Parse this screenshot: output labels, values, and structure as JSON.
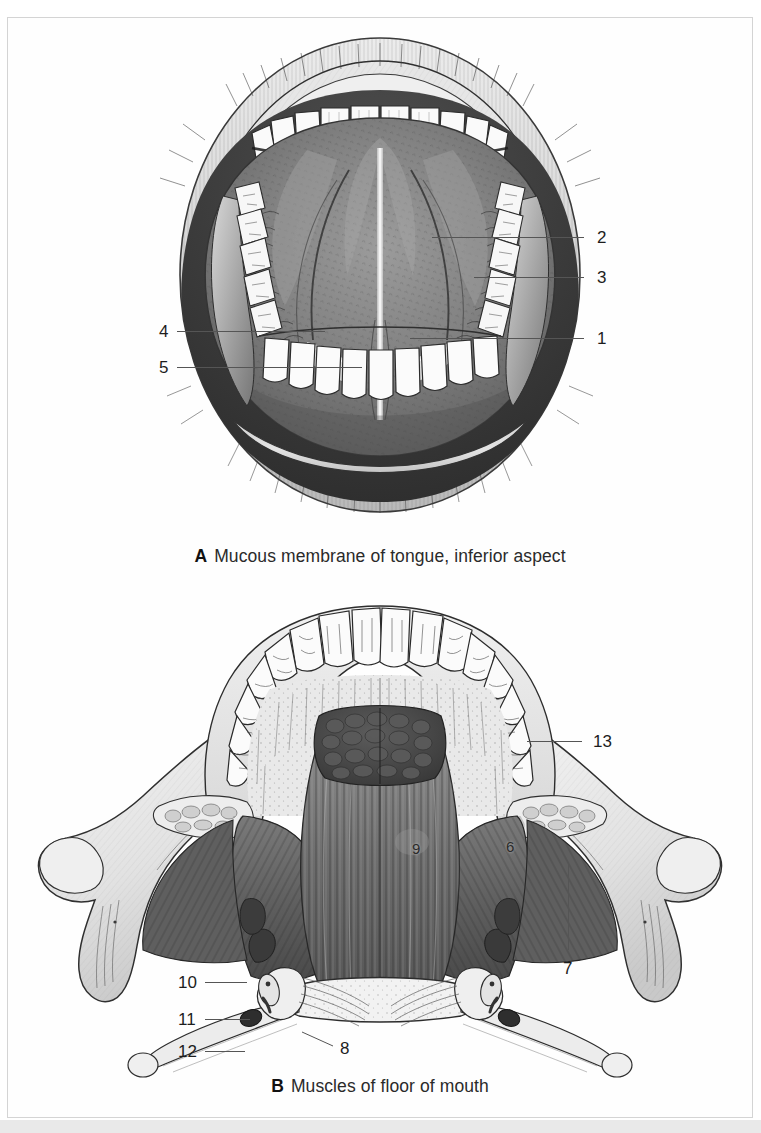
{
  "page": {
    "background_color": "#ffffff",
    "frame_color": "#d4d4d4",
    "bottom_strip_color": "#e9e9e9"
  },
  "figures": [
    {
      "id": "A",
      "letter": "A",
      "caption": "Mucous membrane of tongue, inferior aspect",
      "subject": "open mouth viewed from below, underside of tongue with upper and lower teeth",
      "labels": [
        {
          "number": "1",
          "side": "right",
          "x": 597,
          "y": 330,
          "leader": {
            "x1": 410,
            "y1": 338,
            "x2": 584,
            "y2": 338
          }
        },
        {
          "number": "2",
          "side": "right",
          "x": 597,
          "y": 229,
          "leader": {
            "x1": 432,
            "y1": 237,
            "x2": 584,
            "y2": 237
          }
        },
        {
          "number": "3",
          "side": "right",
          "x": 597,
          "y": 269,
          "leader": {
            "x1": 474,
            "y1": 277,
            "x2": 584,
            "y2": 277
          }
        },
        {
          "number": "4",
          "side": "left",
          "x": 159,
          "y": 323,
          "leader": {
            "x1": 177,
            "y1": 331,
            "x2": 325,
            "y2": 331
          }
        },
        {
          "number": "5",
          "side": "left",
          "x": 159,
          "y": 359,
          "leader": {
            "x1": 177,
            "y1": 367,
            "x2": 362,
            "y2": 367
          }
        }
      ]
    },
    {
      "id": "B",
      "letter": "B",
      "caption": "Muscles of floor of mouth",
      "subject": "mandible viewed from above with teeth arch, genioglossus, mylohyoid and hyoid apparatus",
      "labels": [
        {
          "number": "6",
          "side": "overlay",
          "x": 506,
          "y": 839,
          "leader": null
        },
        {
          "number": "7",
          "side": "right",
          "x": 563,
          "y": 960,
          "leader": {
            "x1": 568,
            "y1": 862,
            "x2": 568,
            "y2": 950
          }
        },
        {
          "number": "8",
          "side": "overlay-line",
          "x": 340,
          "y": 1040,
          "leader": {
            "x1": 302,
            "y1": 1032,
            "x2": 333,
            "y2": 1046
          }
        },
        {
          "number": "9",
          "side": "overlay",
          "x": 412,
          "y": 841,
          "leader": null
        },
        {
          "number": "10",
          "side": "left",
          "x": 178,
          "y": 974,
          "leader": {
            "x1": 205,
            "y1": 982,
            "x2": 247,
            "y2": 982
          }
        },
        {
          "number": "11",
          "side": "left",
          "x": 178,
          "y": 1011,
          "leader": {
            "x1": 205,
            "y1": 1019,
            "x2": 250,
            "y2": 1019
          }
        },
        {
          "number": "12",
          "side": "left",
          "x": 178,
          "y": 1043,
          "leader": {
            "x1": 205,
            "y1": 1051,
            "x2": 245,
            "y2": 1051
          }
        },
        {
          "number": "13",
          "side": "right",
          "x": 593,
          "y": 733,
          "leader": {
            "x1": 527,
            "y1": 741,
            "x2": 582,
            "y2": 741
          }
        }
      ]
    }
  ],
  "palette": {
    "ink": "#1d1d1d",
    "leader_line": "#555555",
    "tongue_dark": "#6f6f6f",
    "tongue_mid": "#8d8d8d",
    "tongue_light": "#a8a8a8",
    "lip_light": "#dcdcdc",
    "tooth_white": "#fbfbfb",
    "muscle_dark": "#555555",
    "muscle_mid": "#707070",
    "bone_light": "#ededed",
    "gland_dark": "#4a4a4a"
  }
}
